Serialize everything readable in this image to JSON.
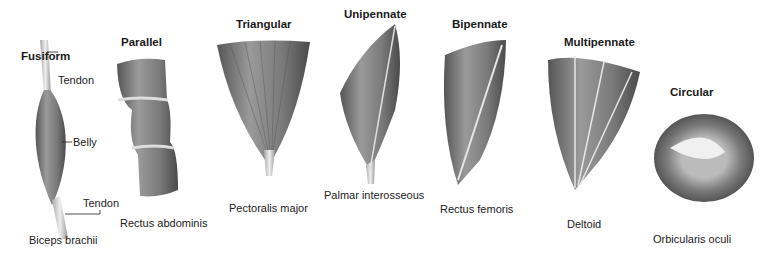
{
  "diagram": {
    "topic": "Muscle fascicle arrangements",
    "shapes": [
      {
        "title": "Fusiform",
        "example": "Biceps brachii",
        "callouts": [
          "Tendon",
          "Belly",
          "Tendon"
        ]
      },
      {
        "title": "Parallel",
        "example": "Rectus abdominis"
      },
      {
        "title": "Triangular",
        "example": "Pectoralis major"
      },
      {
        "title": "Unipennate",
        "example": "Palmar interosseous"
      },
      {
        "title": "Bipennate",
        "example": "Rectus femoris"
      },
      {
        "title": "Multipennate",
        "example": "Deltoid"
      },
      {
        "title": "Circular",
        "example": "Orbicularis oculi"
      }
    ]
  },
  "colors": {
    "muscle_dark": "#5a5a5a",
    "muscle_mid": "#8c8c8c",
    "muscle_light": "#c8c8c8",
    "tendon": "#d8d8d8",
    "text": "#1a1a1a"
  }
}
